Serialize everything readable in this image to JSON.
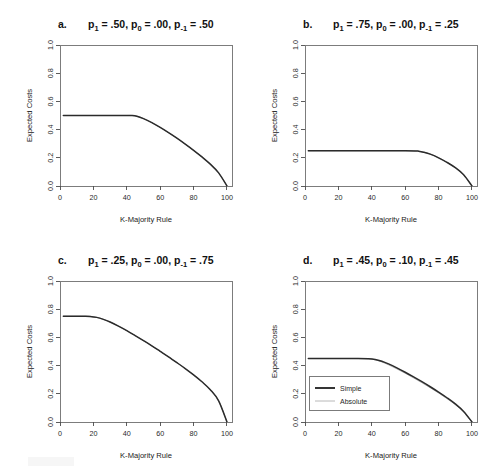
{
  "figure": {
    "background_color": "#ffffff",
    "layout": "2x2 grid of line plots"
  },
  "axes": {
    "xlabel": "K-Majority Rule",
    "ylabel": "Expected Costs",
    "xticks": [
      "0",
      "20",
      "40",
      "60",
      "80",
      "100"
    ],
    "yticks": [
      "0.0",
      "0.2",
      "0.4",
      "0.6",
      "0.8",
      "1.0"
    ]
  },
  "legend": {
    "title": "",
    "entries": [
      {
        "label": "Simple",
        "color": "#2b2b2b",
        "style": "thick"
      },
      {
        "label": "Absolute",
        "color": "#9a9a9a",
        "style": "thin"
      }
    ]
  },
  "panels": [
    {
      "letter": "a.",
      "title_parts": [
        {
          "base": "p",
          "sub": "1",
          "value": " = .50,"
        },
        {
          "base": "p",
          "sub": "0",
          "value": " = .00,"
        },
        {
          "base": "p",
          "sub": "-1",
          "value": " = .50"
        }
      ],
      "title_text": "p1 = .50, p0 = .00, p-1 = .50",
      "plateau": 0.5,
      "breakpoint": 43,
      "show_legend": false
    },
    {
      "letter": "b.",
      "title_parts": [
        {
          "base": "p",
          "sub": "1",
          "value": " = .75,"
        },
        {
          "base": "p",
          "sub": "0",
          "value": " = .00,"
        },
        {
          "base": "p",
          "sub": "-1",
          "value": " = .25"
        }
      ],
      "title_text": "p1 = .75, p0 = .00, p-1 = .25",
      "plateau": 0.25,
      "breakpoint": 68,
      "show_legend": false
    },
    {
      "letter": "c.",
      "title_parts": [
        {
          "base": "p",
          "sub": "1",
          "value": " = .25,"
        },
        {
          "base": "p",
          "sub": "0",
          "value": " = .00,"
        },
        {
          "base": "p",
          "sub": "-1",
          "value": " = .75"
        }
      ],
      "title_text": "p1 = .25, p0 = .00, p-1 = .75",
      "plateau": 0.75,
      "breakpoint": 18,
      "show_legend": false
    },
    {
      "letter": "d.",
      "title_parts": [
        {
          "base": "p",
          "sub": "1",
          "value": " = .45,"
        },
        {
          "base": "p",
          "sub": "0",
          "value": " = .10,"
        },
        {
          "base": "p",
          "sub": "-1",
          "value": " = .45"
        }
      ],
      "title_text": "p1 = .45, p0 = .10, p-1 = .45",
      "plateau": 0.45,
      "breakpoint": 40,
      "show_legend": true
    }
  ],
  "chart_data": [
    {
      "type": "line",
      "panel": "a",
      "title": "p1 = .50, p0 = .00, p-1 = .50",
      "xlabel": "K-Majority Rule",
      "ylabel": "Expected Costs",
      "xlim": [
        0,
        103
      ],
      "ylim": [
        0,
        1
      ],
      "grid": false,
      "legend": "none",
      "series": [
        {
          "name": "Simple",
          "x": [
            2,
            10,
            20,
            30,
            40,
            43,
            46,
            50,
            55,
            60,
            65,
            70,
            75,
            80,
            85,
            90,
            95,
            100
          ],
          "values": [
            0.5,
            0.5,
            0.5,
            0.5,
            0.5,
            0.5,
            0.495,
            0.478,
            0.449,
            0.415,
            0.378,
            0.339,
            0.297,
            0.253,
            0.206,
            0.155,
            0.093,
            0.0
          ]
        },
        {
          "name": "Absolute",
          "x": [
            2,
            10,
            20,
            30,
            40,
            43,
            46,
            50,
            55,
            60,
            65,
            70,
            75,
            80,
            85,
            90,
            95,
            100
          ],
          "values": [
            0.5,
            0.5,
            0.5,
            0.5,
            0.5,
            0.5,
            0.495,
            0.478,
            0.449,
            0.415,
            0.378,
            0.339,
            0.297,
            0.253,
            0.206,
            0.155,
            0.093,
            0.0
          ]
        }
      ]
    },
    {
      "type": "line",
      "panel": "b",
      "title": "p1 = .75, p0 = .00, p-1 = .25",
      "xlabel": "K-Majority Rule",
      "ylabel": "Expected Costs",
      "xlim": [
        0,
        103
      ],
      "ylim": [
        0,
        1
      ],
      "grid": false,
      "legend": "none",
      "series": [
        {
          "name": "Simple",
          "x": [
            2,
            10,
            20,
            30,
            40,
            50,
            60,
            66,
            68,
            71,
            75,
            80,
            85,
            90,
            95,
            100
          ],
          "values": [
            0.25,
            0.25,
            0.25,
            0.25,
            0.25,
            0.25,
            0.25,
            0.249,
            0.247,
            0.24,
            0.226,
            0.2,
            0.168,
            0.13,
            0.08,
            0.0
          ]
        },
        {
          "name": "Absolute",
          "x": [
            2,
            10,
            20,
            30,
            40,
            50,
            60,
            66,
            68,
            71,
            75,
            80,
            85,
            90,
            95,
            100
          ],
          "values": [
            0.25,
            0.25,
            0.25,
            0.25,
            0.25,
            0.25,
            0.25,
            0.249,
            0.247,
            0.24,
            0.226,
            0.2,
            0.168,
            0.13,
            0.08,
            0.0
          ]
        }
      ]
    },
    {
      "type": "line",
      "panel": "c",
      "title": "p1 = .25, p0 = .00, p-1 = .75",
      "xlabel": "K-Majority Rule",
      "ylabel": "Expected Costs",
      "xlim": [
        0,
        103
      ],
      "ylim": [
        0,
        1
      ],
      "grid": false,
      "legend": "none",
      "series": [
        {
          "name": "Simple",
          "x": [
            2,
            8,
            14,
            18,
            22,
            26,
            30,
            35,
            40,
            45,
            50,
            55,
            60,
            65,
            70,
            75,
            80,
            85,
            90,
            95,
            100
          ],
          "values": [
            0.75,
            0.75,
            0.75,
            0.749,
            0.742,
            0.728,
            0.709,
            0.68,
            0.648,
            0.613,
            0.577,
            0.54,
            0.501,
            0.462,
            0.421,
            0.379,
            0.334,
            0.285,
            0.229,
            0.15,
            0.0
          ]
        },
        {
          "name": "Absolute",
          "x": [
            2,
            8,
            14,
            18,
            22,
            26,
            30,
            35,
            40,
            45,
            50,
            55,
            60,
            65,
            70,
            75,
            80,
            85,
            90,
            95,
            100
          ],
          "values": [
            0.75,
            0.75,
            0.75,
            0.749,
            0.742,
            0.728,
            0.709,
            0.68,
            0.648,
            0.613,
            0.577,
            0.54,
            0.501,
            0.462,
            0.421,
            0.379,
            0.334,
            0.285,
            0.229,
            0.15,
            0.0
          ]
        }
      ]
    },
    {
      "type": "line",
      "panel": "d",
      "title": "p1 = .45, p0 = .10, p-1 = .45",
      "xlabel": "K-Majority Rule",
      "ylabel": "Expected Costs",
      "xlim": [
        0,
        103
      ],
      "ylim": [
        0,
        1
      ],
      "grid": false,
      "legend": "inside bottom-left",
      "series": [
        {
          "name": "Simple",
          "x": [
            2,
            10,
            20,
            30,
            38,
            42,
            46,
            50,
            55,
            60,
            65,
            70,
            75,
            80,
            85,
            90,
            95,
            100
          ],
          "values": [
            0.45,
            0.45,
            0.45,
            0.45,
            0.449,
            0.444,
            0.431,
            0.412,
            0.384,
            0.353,
            0.32,
            0.286,
            0.25,
            0.212,
            0.172,
            0.128,
            0.075,
            0.0
          ]
        },
        {
          "name": "Absolute",
          "x": [
            2,
            10,
            20,
            30,
            38,
            42,
            46,
            50,
            55,
            60,
            65,
            70,
            75,
            80,
            85,
            90,
            95,
            100
          ],
          "values": [
            0.45,
            0.45,
            0.45,
            0.45,
            0.448,
            0.441,
            0.426,
            0.406,
            0.377,
            0.346,
            0.313,
            0.279,
            0.243,
            0.206,
            0.166,
            0.123,
            0.072,
            0.0
          ]
        }
      ]
    }
  ]
}
